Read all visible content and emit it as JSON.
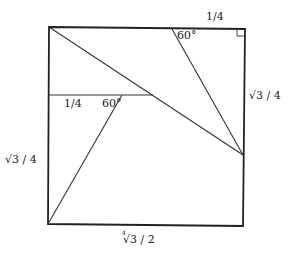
{
  "figure": {
    "type": "geometric-diagram",
    "colors": {
      "background": "#ffffff",
      "stroke": "#333333",
      "text": "#222222"
    },
    "square": {
      "top_left": [
        49,
        27
      ],
      "top_right": [
        245,
        29
      ],
      "bottom_right": [
        243,
        226
      ],
      "bottom_left": [
        48,
        224
      ]
    },
    "segments": [
      {
        "name": "main-diagonal",
        "from": [
          49,
          27
        ],
        "to": [
          243,
          155
        ]
      },
      {
        "name": "upper-60-line",
        "from": [
          172,
          29
        ],
        "to": [
          243,
          155
        ]
      },
      {
        "name": "horizontal-line",
        "from": [
          49,
          95
        ],
        "to": [
          153,
          95
        ]
      },
      {
        "name": "lower-60-line",
        "from": [
          122,
          95
        ],
        "to": [
          48,
          224
        ]
      }
    ],
    "right_angle_marker": {
      "corner": [
        245,
        29
      ],
      "size": 7
    }
  },
  "labels": {
    "top_quarter": "1/4",
    "top_angle": "60°",
    "right_side": "√3 / 4",
    "mid_quarter": "1/4",
    "mid_angle": "60°",
    "left_side": "√3 / 4",
    "bottom_index": "4",
    "bottom_side": "√3 / 2"
  }
}
